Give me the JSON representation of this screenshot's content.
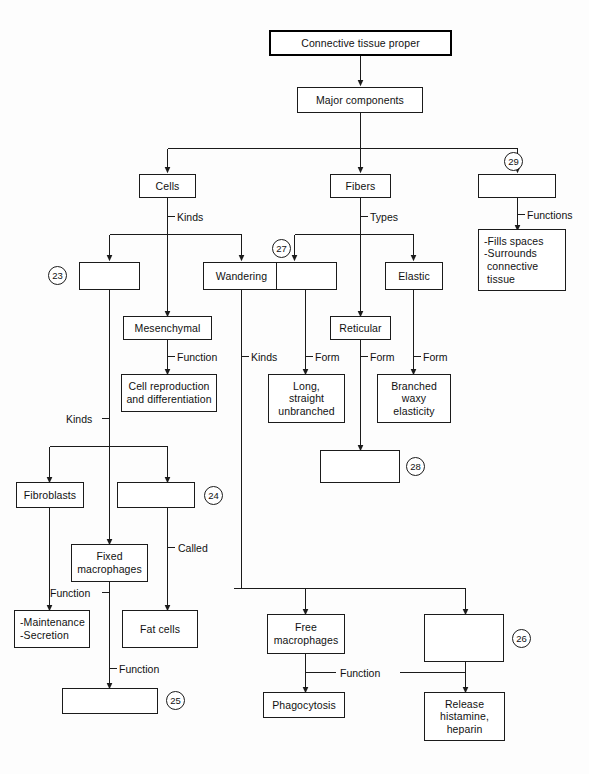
{
  "diagram": {
    "line_color": "#1b1b1b",
    "text_color": "#111111",
    "background": "#fdfdfd",
    "nodes": [
      {
        "id": "root",
        "label": "Connective tissue proper"
      },
      {
        "id": "major",
        "label": "Major components"
      },
      {
        "id": "cells",
        "label": "Cells"
      },
      {
        "id": "fibers",
        "label": "Fibers"
      },
      {
        "id": "blank29",
        "label": ""
      },
      {
        "id": "blank23",
        "label": ""
      },
      {
        "id": "wandering",
        "label": "Wandering"
      },
      {
        "id": "blank27",
        "label": ""
      },
      {
        "id": "elastic",
        "label": "Elastic"
      },
      {
        "id": "fills",
        "line1": "-Fills spaces",
        "line2": "-Surrounds",
        "line3": "connective",
        "line4": "tissue"
      },
      {
        "id": "mesenchymal",
        "label": "Mesenchymal"
      },
      {
        "id": "reticular",
        "label": "Reticular"
      },
      {
        "id": "cellrepro",
        "line1": "Cell reproduction",
        "line2": "and differentiation"
      },
      {
        "id": "longstraight",
        "line1": "Long,",
        "line2": "straight",
        "line3": "unbranched"
      },
      {
        "id": "branched",
        "line1": "Branched",
        "line2": "waxy",
        "line3": "elasticity"
      },
      {
        "id": "blank28",
        "label": ""
      },
      {
        "id": "fibroblasts",
        "label": "Fibroblasts"
      },
      {
        "id": "blank24",
        "label": ""
      },
      {
        "id": "fixedmacro",
        "line1": "Fixed",
        "line2": "macrophages"
      },
      {
        "id": "maintenance",
        "line1": "-Maintenance",
        "line2": "-Secretion"
      },
      {
        "id": "fatcells",
        "label": "Fat cells"
      },
      {
        "id": "blank25",
        "label": ""
      },
      {
        "id": "freemacro",
        "line1": "Free",
        "line2": "macrophages"
      },
      {
        "id": "blank26",
        "label": ""
      },
      {
        "id": "phagocytosis",
        "label": "Phagocytosis"
      },
      {
        "id": "release",
        "line1": "Release",
        "line2": "histamine,",
        "line3": "heparin"
      }
    ],
    "edge_labels": [
      {
        "id": "kinds-cells",
        "text": "Kinds"
      },
      {
        "id": "types-fibers",
        "text": "Types"
      },
      {
        "id": "functions-29",
        "text": "Functions"
      },
      {
        "id": "function-mesen",
        "text": "Function"
      },
      {
        "id": "kinds-wandering",
        "text": "Kinds"
      },
      {
        "id": "form-27",
        "text": "Form"
      },
      {
        "id": "form-reticular",
        "text": "Form"
      },
      {
        "id": "form-elastic",
        "text": "Form"
      },
      {
        "id": "kinds-23",
        "text": "Kinds"
      },
      {
        "id": "called-24",
        "text": "Called"
      },
      {
        "id": "function-fixed",
        "text": "Function"
      },
      {
        "id": "function-25",
        "text": "Function"
      },
      {
        "id": "function-free",
        "text": "Function"
      }
    ],
    "numbered_blanks": [
      {
        "id": "n23",
        "number": "23"
      },
      {
        "id": "n24",
        "number": "24"
      },
      {
        "id": "n25",
        "number": "25"
      },
      {
        "id": "n26",
        "number": "26"
      },
      {
        "id": "n27",
        "number": "27"
      },
      {
        "id": "n28",
        "number": "28"
      },
      {
        "id": "n29",
        "number": "29"
      }
    ]
  }
}
